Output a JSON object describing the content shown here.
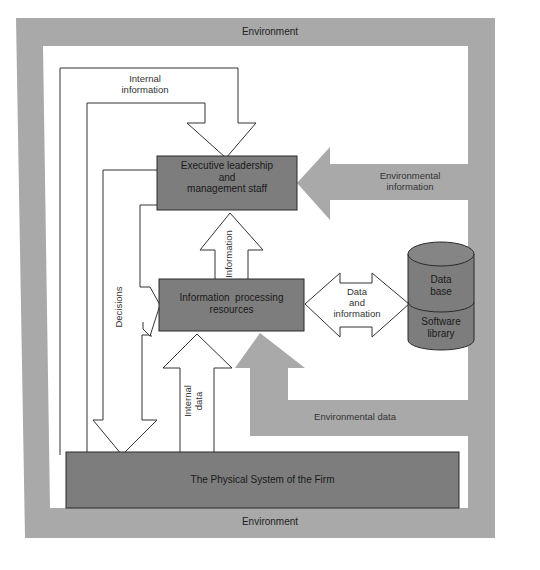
{
  "diagram": {
    "colors": {
      "environment": "#a9a9a9",
      "box_fill": "#7d7d7d",
      "box_stroke": "#2a2a2a",
      "flow_stroke": "#333333",
      "background": "#ffffff"
    },
    "environment": {
      "top_label": "Environment",
      "bottom_label": "Environment"
    },
    "nodes": {
      "executive": {
        "line1": "Executive leadership",
        "line2": "and",
        "line3": "management staff"
      },
      "processing": {
        "line1": "Information  processing",
        "line2": "resources"
      },
      "physical": {
        "label": "The Physical System of the Firm"
      },
      "database": {
        "top_line1": "Data",
        "top_line2": "base",
        "bottom_line1": "Software",
        "bottom_line2": "library"
      }
    },
    "flows": {
      "internal_information": {
        "line1": "Internal",
        "line2": "information"
      },
      "information": {
        "label": "Information"
      },
      "decisions": {
        "label": "Decisions"
      },
      "internal_data": {
        "line1": "Internal",
        "line2": "data"
      },
      "data_and_information": {
        "line1": "Data",
        "line2": "and",
        "line3": "information"
      },
      "environmental_information": {
        "line1": "Environmental",
        "line2": "information"
      },
      "environmental_data": {
        "label": "Environmental data"
      }
    }
  }
}
